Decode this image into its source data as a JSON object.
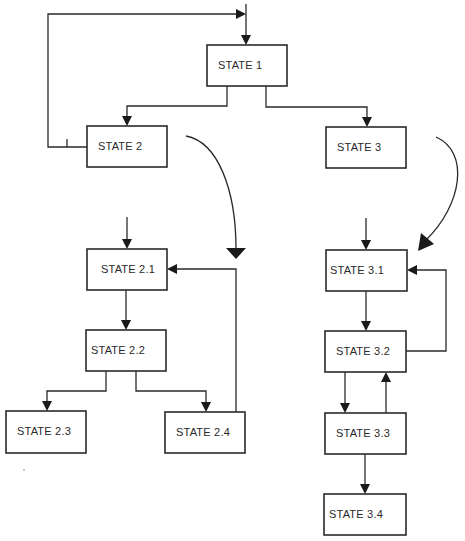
{
  "diagram": {
    "type": "hierarchical state diagram",
    "colors": {
      "line": "#2a2a2a",
      "background": "#ffffff",
      "arrowhead": "#1a1a1a"
    },
    "states": [
      {
        "id": "s1",
        "label": "STATE 1",
        "x": 207,
        "y": 45,
        "w": 80,
        "h": 41
      },
      {
        "id": "s2",
        "label": "STATE 2",
        "x": 87,
        "y": 126,
        "w": 80,
        "h": 41
      },
      {
        "id": "s3",
        "label": "STATE 3",
        "x": 326,
        "y": 127,
        "w": 80,
        "h": 41
      },
      {
        "id": "s21",
        "label": "STATE 2.1",
        "x": 87,
        "y": 249,
        "w": 80,
        "h": 41
      },
      {
        "id": "s22",
        "label": "STATE 2.2",
        "x": 86,
        "y": 330,
        "w": 80,
        "h": 41
      },
      {
        "id": "s23",
        "label": "STATE 2.3",
        "x": 6,
        "y": 411,
        "w": 80,
        "h": 42
      },
      {
        "id": "s24",
        "label": "STATE 2.4",
        "x": 165,
        "y": 412,
        "w": 80,
        "h": 41
      },
      {
        "id": "s31",
        "label": "STATE 3.1",
        "x": 326,
        "y": 250,
        "w": 81,
        "h": 41
      },
      {
        "id": "s32",
        "label": "STATE 3.2",
        "x": 325,
        "y": 331,
        "w": 81,
        "h": 41
      },
      {
        "id": "s33",
        "label": "STATE 3.3",
        "x": 325,
        "y": 413,
        "w": 81,
        "h": 41
      },
      {
        "id": "s34",
        "label": "STATE 3.4",
        "x": 324,
        "y": 494,
        "w": 82,
        "h": 41
      }
    ],
    "transitions": [
      {
        "from": "initial",
        "to": "STATE 1"
      },
      {
        "from": "STATE 1",
        "to": "STATE 2"
      },
      {
        "from": "STATE 1",
        "to": "STATE 3"
      },
      {
        "from": "STATE 2",
        "to": "STATE 1",
        "note": "return loop"
      },
      {
        "from": "STATE 2",
        "to": "STATE 2 substates",
        "note": "refinement (curved)"
      },
      {
        "from": "STATE 3",
        "to": "STATE 3 substates",
        "note": "refinement (curved)"
      },
      {
        "from": "initial",
        "to": "STATE 2.1"
      },
      {
        "from": "STATE 2.1",
        "to": "STATE 2.2"
      },
      {
        "from": "STATE 2.2",
        "to": "STATE 2.3"
      },
      {
        "from": "STATE 2.2",
        "to": "STATE 2.4"
      },
      {
        "from": "STATE 2.4",
        "to": "STATE 2.1"
      },
      {
        "from": "initial",
        "to": "STATE 3.1"
      },
      {
        "from": "STATE 3.1",
        "to": "STATE 3.2"
      },
      {
        "from": "STATE 3.2",
        "to": "STATE 3.1"
      },
      {
        "from": "STATE 3.2",
        "to": "STATE 3.3"
      },
      {
        "from": "STATE 3.3",
        "to": "STATE 3.2"
      },
      {
        "from": "STATE 3.3",
        "to": "STATE 3.4"
      }
    ]
  }
}
